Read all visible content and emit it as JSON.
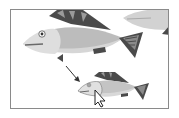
{
  "canvas": {
    "description": "Artboard showing fish illustrations with a drag arrow and selection cursor",
    "colors": {
      "body_light": "#cfcfcf",
      "body_mid": "#b9b9b9",
      "head": "#dcdcdc",
      "fin_dark": "#4a4a4a",
      "fin_mid": "#7a7a7a",
      "frame": "#8a8a8a"
    }
  },
  "objects": [
    {
      "name": "large-fish",
      "selected": false
    },
    {
      "name": "partial-fish-top-right",
      "selected": false
    },
    {
      "name": "small-fish-copy",
      "selected": true
    }
  ],
  "cursor": {
    "type": "selection-arrow"
  },
  "annotation": {
    "type": "arrow",
    "direction": "down-right"
  }
}
